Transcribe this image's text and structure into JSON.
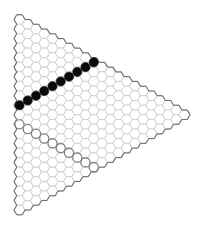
{
  "board": {
    "type": "triangular-hex-board",
    "columns": 21,
    "hex_orientation": "flat-top",
    "cell_width": 11,
    "origin": [
      19.5,
      19.5
    ],
    "colors": {
      "cell_fill": "#ffffff",
      "cell_stroke": "#c8c8c8",
      "border": "#6e6e6e",
      "black_stone": "#0a0a0a",
      "white_stone": "#ffffff",
      "white_stone_stroke": "#7a7a7a"
    }
  },
  "stones": {
    "black": [
      [
        0,
        9
      ],
      [
        1,
        8
      ],
      [
        2,
        7
      ],
      [
        3,
        6
      ],
      [
        4,
        5
      ],
      [
        5,
        4
      ],
      [
        6,
        3
      ],
      [
        7,
        2
      ],
      [
        8,
        1
      ],
      [
        9,
        0
      ]
    ],
    "white": [
      [
        0,
        11
      ],
      [
        1,
        11
      ],
      [
        2,
        11
      ],
      [
        3,
        11
      ],
      [
        4,
        11
      ],
      [
        5,
        11
      ],
      [
        6,
        11
      ],
      [
        7,
        11
      ],
      [
        8,
        11
      ],
      [
        9,
        11
      ]
    ]
  }
}
